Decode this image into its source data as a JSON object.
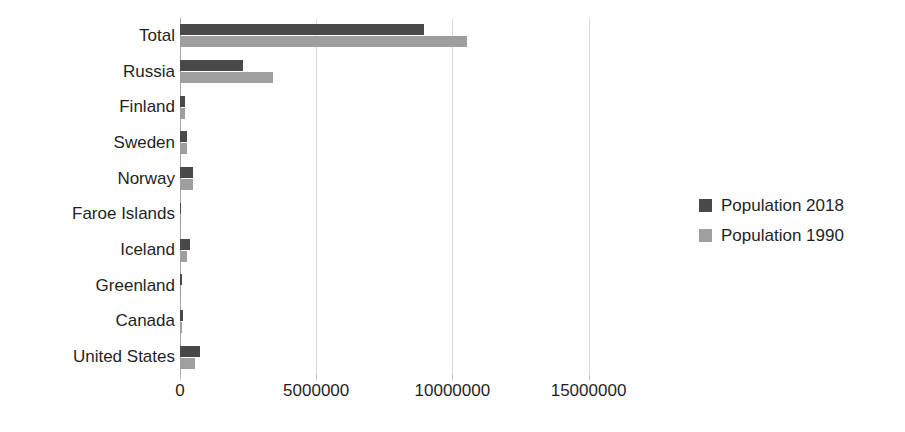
{
  "chart_data": {
    "type": "bar",
    "orientation": "horizontal",
    "title": "",
    "xlabel": "",
    "ylabel": "",
    "xlim": [
      0,
      17000000
    ],
    "xticks": [
      0,
      5000000,
      10000000,
      15000000
    ],
    "xticklabels": [
      "0",
      "5000000",
      "10000000",
      "15000000"
    ],
    "grid": true,
    "legend_position": "right",
    "categories": [
      "Total",
      "Russia",
      "Finland",
      "Sweden",
      "Norway",
      "Faroe Islands",
      "Iceland",
      "Greenland",
      "Canada",
      "United States"
    ],
    "series": [
      {
        "name": "Population 2018",
        "color": "#494949",
        "values": [
          8950000,
          2330000,
          185000,
          250000,
          480000,
          50000,
          350000,
          56000,
          120000,
          740000
        ]
      },
      {
        "name": "Population 1990",
        "color": "#9f9f9f",
        "values": [
          10550000,
          3400000,
          200000,
          260000,
          460000,
          48000,
          255000,
          55000,
          90000,
          550000
        ]
      }
    ]
  },
  "legend": {
    "items": [
      {
        "label": "Population 2018",
        "color": "#494949"
      },
      {
        "label": "Population 1990",
        "color": "#9f9f9f"
      }
    ]
  },
  "axis": {
    "x_tick_labels": [
      "0",
      "5000000",
      "10000000",
      "15000000"
    ]
  },
  "colors": {
    "series_2018": "#494949",
    "series_1990": "#9f9f9f",
    "gridline": "#d9d9d9",
    "axis": "#a6a6a6",
    "background": "#ffffff",
    "text": "#1f1f1f"
  }
}
